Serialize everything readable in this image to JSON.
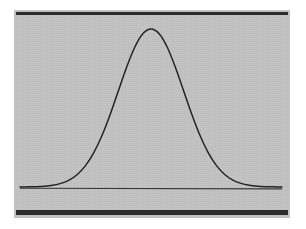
{
  "figure": {
    "caption": "",
    "background_color": "#ffffff",
    "plate_color": "#c2c2c2",
    "ink_color": "#242424",
    "rule_color": "#2b2b2b",
    "axis_color": "#3a3a3a"
  },
  "chart_data": {
    "type": "line",
    "title": "",
    "subtitle": "",
    "xlabel": "",
    "ylabel": "",
    "grid": false,
    "legend": null,
    "legend_position": "none",
    "annotations": [],
    "xticks": [],
    "yticks": [],
    "xticklabels": [],
    "yticklabels": [],
    "xlim": [
      -4,
      4
    ],
    "ylim": [
      0,
      0.4
    ],
    "distribution": {
      "name": "normal",
      "mean": 0,
      "std_dev": 1,
      "peak_value": 0.399
    },
    "series": [
      {
        "name": "normal-pdf",
        "color": "#242424",
        "x": [
          -4,
          -3.75,
          -3.5,
          -3.25,
          -3,
          -2.75,
          -2.5,
          -2.25,
          -2,
          -1.75,
          -1.5,
          -1.25,
          -1,
          -0.75,
          -0.5,
          -0.25,
          0,
          0.25,
          0.5,
          0.75,
          1,
          1.25,
          1.5,
          1.75,
          2,
          2.25,
          2.5,
          2.75,
          3,
          3.25,
          3.5,
          3.75,
          4
        ],
        "values": [
          0.0001,
          0.0004,
          0.0009,
          0.002,
          0.0044,
          0.0091,
          0.0175,
          0.0317,
          0.054,
          0.0863,
          0.1295,
          0.1826,
          0.242,
          0.3011,
          0.3521,
          0.3867,
          0.3989,
          0.3867,
          0.3521,
          0.3011,
          0.242,
          0.1826,
          0.1295,
          0.0863,
          0.054,
          0.0317,
          0.0175,
          0.0091,
          0.0044,
          0.002,
          0.0009,
          0.0004,
          0.0001
        ]
      }
    ],
    "baseline": {
      "name": "horizontal-axis",
      "y": 0,
      "color": "#3a3a3a"
    }
  }
}
